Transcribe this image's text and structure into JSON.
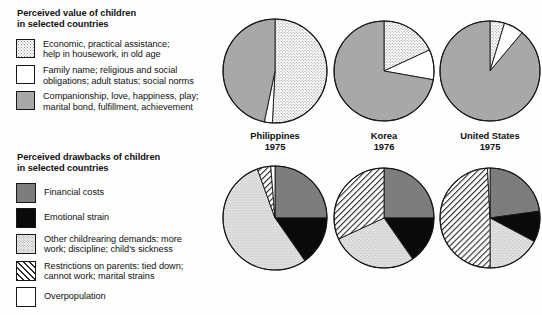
{
  "legends": [
    {
      "id": "perceived-value",
      "title": "Perceived value of children\nin selected countries",
      "items": [
        {
          "pattern": "dots",
          "label": "Economic, practical assistance;\nhelp in housework, in old age"
        },
        {
          "pattern": "white",
          "label": "Family name; religious and social\nobligations; adult status; social norms"
        },
        {
          "pattern": "gray",
          "label": "Companionship, love, happiness, play;\nmarital bond, fulfillment, achievement"
        }
      ]
    },
    {
      "id": "perceived-drawbacks",
      "title": "Perceived drawbacks of children\nin selected countries",
      "items": [
        {
          "pattern": "darkgray",
          "label": "Financial costs"
        },
        {
          "pattern": "black",
          "label": "Emotional strain"
        },
        {
          "pattern": "lightdots",
          "label": "Other childrearing demands: more\nwork; discipline; child's sickness"
        },
        {
          "pattern": "hatch",
          "label": "Restrictions on parents: tied down;\ncannot work; marital strains"
        },
        {
          "pattern": "white",
          "label": "Overpopulation"
        }
      ]
    }
  ],
  "countries": [
    {
      "name": "Philippines",
      "year": "1975"
    },
    {
      "name": "Korea",
      "year": "1976"
    },
    {
      "name": "United States",
      "year": "1975"
    }
  ],
  "colors": {
    "gray": "#a8a8a8",
    "darkgray": "#7d7d7d",
    "black": "#0a0a0a",
    "white": "#ffffff",
    "outline": "#161616"
  },
  "chart_data": [
    {
      "type": "pie",
      "title": "Perceived value of children — Philippines 1975",
      "country": "Philippines",
      "year": "1975",
      "labels": [
        "Economic, practical assistance; help in housework, in old age",
        "Family name; religious and social obligations; adult status; social norms",
        "Companionship, love, happiness, play; marital bond, fulfillment, achievement"
      ],
      "patterns": [
        "dots",
        "white",
        "gray"
      ],
      "values": [
        50.8,
        2.5,
        46.7
      ],
      "start_angle_deg": 0,
      "direction": "clockwise"
    },
    {
      "type": "pie",
      "title": "Perceived value of children — Korea 1976",
      "country": "Korea",
      "year": "1976",
      "labels": [
        "Economic, practical assistance; help in housework, in old age",
        "Family name; religious and social obligations; adult status; social norms",
        "Companionship, love, happiness, play; marital bond, fulfillment, achievement"
      ],
      "patterns": [
        "dots",
        "white",
        "gray"
      ],
      "values": [
        18.1,
        9.7,
        72.2
      ],
      "start_angle_deg": 0,
      "direction": "clockwise"
    },
    {
      "type": "pie",
      "title": "Perceived value of children — United States 1975",
      "country": "United States",
      "year": "1975",
      "labels": [
        "Economic, practical assistance; help in housework, in old age",
        "Family name; religious and social obligations; adult status; social norms",
        "Companionship, love, happiness, play; marital bond, fulfillment, achievement"
      ],
      "patterns": [
        "dots",
        "white",
        "gray"
      ],
      "values": [
        4.7,
        6.4,
        88.9
      ],
      "start_angle_deg": 0,
      "direction": "clockwise"
    },
    {
      "type": "pie",
      "title": "Perceived drawbacks of children — Philippines 1975",
      "country": "Philippines",
      "year": "1975",
      "labels": [
        "Financial costs",
        "Emotional strain",
        "Other childrearing demands: more work; discipline; child's sickness",
        "Restrictions on parents: tied down; cannot work; marital strains",
        "Overpopulation"
      ],
      "patterns": [
        "darkgray",
        "black",
        "lightdots",
        "hatch",
        "white"
      ],
      "values": [
        25.0,
        15.3,
        54.2,
        4.2,
        1.3
      ],
      "start_angle_deg": 0,
      "direction": "clockwise"
    },
    {
      "type": "pie",
      "title": "Perceived drawbacks of children — Korea 1976",
      "country": "Korea",
      "year": "1976",
      "labels": [
        "Financial costs",
        "Emotional strain",
        "Other childrearing demands: more work; discipline; child's sickness",
        "Restrictions on parents: tied down; cannot work; marital strains",
        "Overpopulation"
      ],
      "patterns": [
        "darkgray",
        "black",
        "lightdots",
        "hatch",
        "white"
      ],
      "values": [
        25.0,
        15.3,
        27.8,
        31.9,
        0.0
      ],
      "start_angle_deg": 0,
      "direction": "clockwise"
    },
    {
      "type": "pie",
      "title": "Perceived drawbacks of children — United States 1975",
      "country": "United States",
      "year": "1975",
      "labels": [
        "Financial costs",
        "Emotional strain",
        "Other childrearing demands: more work; discipline; child's sickness",
        "Restrictions on parents: tied down; cannot work; marital strains",
        "Overpopulation"
      ],
      "patterns": [
        "darkgray",
        "black",
        "lightdots",
        "hatch",
        "white"
      ],
      "values": [
        22.8,
        10.0,
        17.2,
        49.2,
        0.8
      ],
      "start_angle_deg": 0,
      "direction": "clockwise"
    }
  ]
}
